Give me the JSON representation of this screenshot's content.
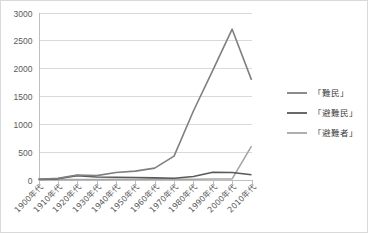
{
  "chart_data": {
    "type": "line",
    "title": "",
    "subtitle": "",
    "xlabel": "",
    "ylabel": "",
    "ylim": [
      0,
      3000
    ],
    "ytick_step": 500,
    "ytick_labels": [
      "0",
      "500",
      "1000",
      "1500",
      "2000",
      "2500",
      "3000"
    ],
    "grid": true,
    "legend_position": "right",
    "categories": [
      "1900年代",
      "1910年代",
      "1920年代",
      "1930年代",
      "1940年代",
      "1950年代",
      "1960年代",
      "1970年代",
      "1980年代",
      "1990年代",
      "2000年代",
      "2010年代"
    ],
    "series": [
      {
        "name": "「難民」",
        "color": "#7f7f7f",
        "values": [
          5,
          20,
          80,
          70,
          125,
          150,
          205,
          420,
          1230,
          1960,
          2700,
          1790
        ]
      },
      {
        "name": "「避難民」",
        "color": "#595959",
        "values": [
          3,
          12,
          70,
          45,
          40,
          35,
          30,
          22,
          55,
          130,
          125,
          85
        ]
      },
      {
        "name": "「避難者」",
        "color": "#a6a6a6",
        "values": [
          0,
          0,
          0,
          0,
          5,
          5,
          5,
          5,
          5,
          8,
          10,
          600
        ]
      }
    ]
  },
  "legend": {
    "entries": [
      {
        "label": "「難民」",
        "color": "#7f7f7f"
      },
      {
        "label": "「避難民」",
        "color": "#595959"
      },
      {
        "label": "「避難者」",
        "color": "#a6a6a6"
      }
    ]
  },
  "axes": {
    "y_axis_name": "value-axis",
    "x_axis_name": "category-axis"
  }
}
